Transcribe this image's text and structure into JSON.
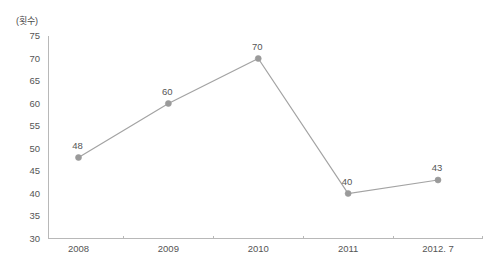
{
  "chart_data": {
    "type": "line",
    "title": "",
    "subtitle": "",
    "xlabel": "",
    "ylabel": "(횟수)",
    "categories": [
      "2008",
      "2009",
      "2010",
      "2011",
      "2012. 7"
    ],
    "values": [
      48,
      60,
      70,
      40,
      43
    ],
    "point_labels": [
      "48",
      "60",
      "70",
      "40",
      "43"
    ],
    "ylim": [
      30,
      75
    ],
    "ytick_labels": [
      "75",
      "70",
      "65",
      "60",
      "55",
      "50",
      "45",
      "40",
      "35",
      "30"
    ],
    "ytick_values": [
      75,
      70,
      65,
      60,
      55,
      50,
      45,
      40,
      35,
      30
    ],
    "grid": false,
    "legend": false,
    "legend_position": "none",
    "series": [
      {
        "name": "횟수",
        "values": [
          48,
          60,
          70,
          40,
          43
        ]
      }
    ],
    "colors": {
      "line": "#a3a3a3",
      "marker": "#9a9a9a",
      "axis": "#b8b8b8",
      "text": "#555555",
      "background": "#ffffff"
    }
  },
  "annotations": {
    "top_edge_artifact": ""
  }
}
